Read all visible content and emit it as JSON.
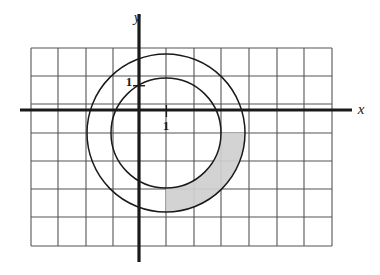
{
  "figure": {
    "background_color": "#ffffff"
  },
  "axes": {
    "x_axis_label": "x",
    "y_axis_label": "y",
    "axis_color": "#1a1a1a",
    "origin_px": {
      "x": 139,
      "y": 110
    },
    "x_tick_label": "1",
    "y_tick_label": "1"
  },
  "grid": {
    "line_color": "#555555",
    "vertical_lines_x": [
      31,
      58,
      86,
      113,
      139,
      166,
      194,
      221,
      249,
      277,
      304,
      332
    ],
    "horizontal_lines_y": [
      48,
      76,
      104,
      133,
      161,
      189,
      217,
      246
    ],
    "cell_width_px": 27.4,
    "cell_height_px": 28.2,
    "x_extent_px": [
      31,
      332
    ],
    "y_extent_px": [
      48,
      246
    ]
  },
  "chart_data": {
    "type": "scatter",
    "xlabel": "x",
    "ylabel": "y",
    "grid": true,
    "legend": false,
    "unit_cell": {
      "width_px": 27.4,
      "height_px": 28.2
    },
    "annotations": [
      {
        "text": "1",
        "role": "y-axis-unit-mark",
        "px": {
          "x": 129,
          "y": 86
        }
      },
      {
        "text": "1",
        "role": "x-axis-unit-mark",
        "px": {
          "x": 166,
          "y": 130
        }
      },
      {
        "text": "y",
        "role": "y-axis-name",
        "px": {
          "x": 137,
          "y": 22
        }
      },
      {
        "text": "x",
        "role": "x-axis-name",
        "px": {
          "x": 361,
          "y": 114
        }
      }
    ],
    "shapes": [
      {
        "name": "outer-circle",
        "type": "circle",
        "center_px": {
          "x": 166,
          "y": 133
        },
        "radius_px": 79,
        "center_units": {
          "x": 1,
          "y": -0.8
        },
        "radius_units": 2.85,
        "stroke": "#1a1a1a",
        "fill": "none"
      },
      {
        "name": "inner-circle",
        "type": "circle",
        "center_px": {
          "x": 166,
          "y": 133
        },
        "radius_px": 55,
        "center_units": {
          "x": 1,
          "y": -0.8
        },
        "radius_units": 2.0,
        "stroke": "#1a1a1a",
        "fill": "none"
      },
      {
        "name": "shaded-annulus-quarter",
        "type": "annulus-sector",
        "center_px": {
          "x": 166,
          "y": 133
        },
        "inner_radius_px": 55,
        "outer_radius_px": 79,
        "start_angle_deg": 0,
        "end_angle_deg": 90,
        "quadrant": "lower-right",
        "fill": "#cfcfcf"
      }
    ]
  }
}
